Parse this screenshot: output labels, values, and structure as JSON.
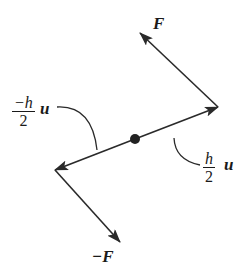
{
  "diagram": {
    "type": "force-couple",
    "center_point": {
      "x": 135,
      "y": 139
    },
    "vectors": [
      {
        "id": "pos-half-u",
        "from": [
          135,
          139
        ],
        "to": [
          218,
          107
        ]
      },
      {
        "id": "neg-half-u",
        "from": [
          135,
          139
        ],
        "to": [
          55,
          170
        ]
      },
      {
        "id": "force-F",
        "from": [
          218,
          107
        ],
        "to": [
          140,
          33
        ]
      },
      {
        "id": "force-neg-F",
        "from": [
          55,
          170
        ],
        "to": [
          120,
          242
        ]
      }
    ],
    "labels": {
      "force_top": "F",
      "force_bottom": "−F",
      "neg_half_num": "−h",
      "neg_half_den": "2",
      "neg_half_vec": "u",
      "pos_half_num": "h",
      "pos_half_den": "2",
      "pos_half_vec": "u"
    },
    "colors": {
      "stroke": "#2a2a2a",
      "background": "#ffffff"
    }
  }
}
